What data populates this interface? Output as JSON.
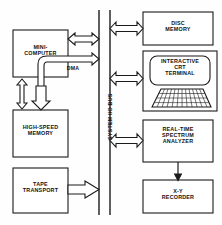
{
  "diagram": {
    "bus": {
      "label": "SYSTEM I/O BUS"
    },
    "dma": {
      "label": "DMA"
    },
    "left_blocks": [
      {
        "id": "mini-computer",
        "line1": "MINI-",
        "line2": "COMPUTER"
      },
      {
        "id": "high-speed-memory",
        "line1": "HIGH-SPEED",
        "line2": "MEMORY"
      },
      {
        "id": "tape-transport",
        "line1": "TAPE",
        "line2": "TRANSPORT"
      }
    ],
    "right_blocks": [
      {
        "id": "disc-memory",
        "line1": "DISC",
        "line2": "MEMORY",
        "line3": ""
      },
      {
        "id": "crt-terminal",
        "line1": "INTERACTIVE",
        "line2": "CRT",
        "line3": "TERMINAL"
      },
      {
        "id": "spectrum-analyzer",
        "line1": "REAL-TIME",
        "line2": "SPECTRUM",
        "line3": "ANALYZER"
      },
      {
        "id": "xy-recorder",
        "line1": "X-Y",
        "line2": "RECORDER",
        "line3": ""
      }
    ],
    "colors": {
      "ink": "#1b1b1b",
      "paper": "#fefefe",
      "fill": "#ffffff"
    }
  }
}
